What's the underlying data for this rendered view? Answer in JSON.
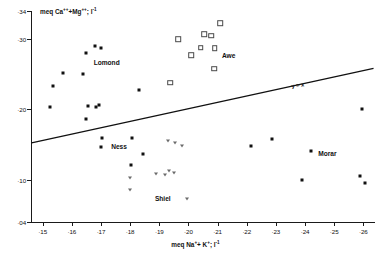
{
  "chart_data": {
    "type": "scatter",
    "title": "",
    "xlabel": "meq Na+ + K+; l-1",
    "ylabel": "meq Ca++ + Mg++; l-1",
    "xlabel_html": "meq Na<sup>+</sup>+ K<sup>+</sup>; l<sup>-1</sup>",
    "ylabel_html": "meq Ca<sup>++</sup>+Mg<sup>++</sup>; l<sup>-1</sup>",
    "xlim": [
      14.6,
      26.4
    ],
    "ylim": [
      0.4,
      3.4
    ],
    "x_ticks": [
      "·15",
      "·16",
      "·17",
      "·18",
      "·19",
      "·20",
      "·21",
      "·22",
      "·23",
      "·24",
      "·25",
      "·26"
    ],
    "x_tick_values": [
      15,
      16,
      17,
      18,
      19,
      20,
      21,
      22,
      23,
      24,
      25,
      26
    ],
    "y_ticks": [
      "·34",
      "·30",
      "·20",
      "·10",
      "·04"
    ],
    "y_tick_values": [
      3.4,
      3.0,
      2.0,
      1.0,
      0.4
    ],
    "grid": false,
    "legend": "none",
    "note": "x axis increases left to right; values are decimal fractions shown with leading centred dot",
    "annotations": [
      {
        "text": "Lomond",
        "x": 16.75,
        "y": 2.72
      },
      {
        "text": "Awe",
        "x": 21.15,
        "y": 2.82
      },
      {
        "text": "Ness",
        "x": 17.35,
        "y": 1.53
      },
      {
        "text": "Shiel",
        "x": 18.85,
        "y": 0.78
      },
      {
        "text": "Morar",
        "x": 24.45,
        "y": 1.43
      },
      {
        "text": "y = x",
        "x": 23.55,
        "y": 2.38
      }
    ],
    "trend_line": {
      "label": "y = x",
      "x_start": 14.62,
      "y_start": 1.525,
      "x_end": 26.35,
      "y_end": 2.585
    },
    "series": [
      {
        "name": "Lomond",
        "marker": "filled-square",
        "points": [
          {
            "x": 16.8,
            "y": 2.9
          },
          {
            "x": 17.0,
            "y": 2.88
          },
          {
            "x": 16.47,
            "y": 2.8
          },
          {
            "x": 15.7,
            "y": 2.52
          },
          {
            "x": 16.4,
            "y": 2.5
          },
          {
            "x": 15.35,
            "y": 2.34
          },
          {
            "x": 15.25,
            "y": 2.03
          },
          {
            "x": 16.55,
            "y": 2.05
          },
          {
            "x": 16.5,
            "y": 1.86
          },
          {
            "x": 16.82,
            "y": 2.03
          },
          {
            "x": 16.92,
            "y": 2.06
          },
          {
            "x": 18.32,
            "y": 2.27
          }
        ]
      },
      {
        "name": "Awe",
        "marker": "open-square",
        "points": [
          {
            "x": 21.1,
            "y": 3.23
          },
          {
            "x": 20.78,
            "y": 3.05
          },
          {
            "x": 20.55,
            "y": 3.07
          },
          {
            "x": 19.65,
            "y": 3.0
          },
          {
            "x": 20.42,
            "y": 2.88
          },
          {
            "x": 20.9,
            "y": 2.87
          },
          {
            "x": 20.1,
            "y": 2.77
          },
          {
            "x": 20.88,
            "y": 2.58
          },
          {
            "x": 19.38,
            "y": 2.38
          }
        ]
      },
      {
        "name": "Ness",
        "marker": "filled-square",
        "points": [
          {
            "x": 17.05,
            "y": 1.6
          },
          {
            "x": 17.0,
            "y": 1.47
          },
          {
            "x": 18.05,
            "y": 1.6
          },
          {
            "x": 18.02,
            "y": 1.21
          },
          {
            "x": 18.45,
            "y": 1.36
          }
        ]
      },
      {
        "name": "Shiel",
        "marker": "open-triangle-down",
        "points": [
          {
            "x": 19.55,
            "y": 1.52
          },
          {
            "x": 19.3,
            "y": 1.55
          },
          {
            "x": 19.78,
            "y": 1.48
          },
          {
            "x": 18.0,
            "y": 1.02
          },
          {
            "x": 18.0,
            "y": 0.86
          },
          {
            "x": 18.9,
            "y": 1.08
          },
          {
            "x": 19.2,
            "y": 1.07
          },
          {
            "x": 19.35,
            "y": 1.13
          },
          {
            "x": 19.52,
            "y": 1.1
          },
          {
            "x": 19.95,
            "y": 0.73
          }
        ]
      },
      {
        "name": "Morar",
        "marker": "filled-square",
        "points": [
          {
            "x": 22.15,
            "y": 1.48
          },
          {
            "x": 22.85,
            "y": 1.58
          },
          {
            "x": 24.2,
            "y": 1.41
          },
          {
            "x": 23.9,
            "y": 1.0
          },
          {
            "x": 25.95,
            "y": 2.0
          },
          {
            "x": 25.9,
            "y": 1.06
          },
          {
            "x": 26.05,
            "y": 0.96
          }
        ]
      }
    ]
  }
}
